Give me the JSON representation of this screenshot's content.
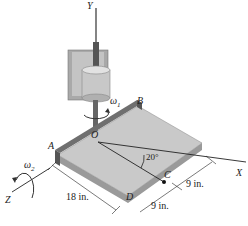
{
  "diagram": {
    "axes": {
      "y": "Y",
      "x": "X",
      "z": "Z"
    },
    "points": {
      "a": "A",
      "b": "B",
      "o": "O",
      "c": "C",
      "d": "D"
    },
    "angular_velocities": {
      "w1": "ω",
      "w1_sub": "1",
      "w2": "ω",
      "w2_sub": "2"
    },
    "angle": "20°",
    "dimensions": {
      "length_ad": "18 in.",
      "seg_upper": "9 in.",
      "seg_lower": "9 in."
    }
  },
  "colors": {
    "plate_top": "#c9c9c9",
    "plate_side": "#9a9a9a",
    "rail": "#6f6f6f",
    "housing": "#b5b5b5",
    "line": "#222222"
  }
}
